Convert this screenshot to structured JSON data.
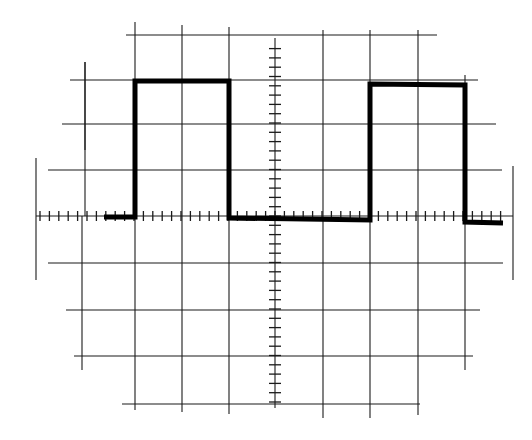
{
  "figure": {
    "type": "oscilloscope-graticule",
    "background": "#ffffff",
    "grid_color": "#1a1a1a",
    "trace_color": "#000000"
  },
  "graticule": {
    "vertical_lines": [
      {
        "x": 85,
        "y1": 62,
        "y2": 150
      },
      {
        "x": 85,
        "y1": 0,
        "y2": 0
      },
      {
        "x": 135,
        "y1": 22,
        "y2": 410
      },
      {
        "x": 182,
        "y1": 25,
        "y2": 412
      },
      {
        "x": 229,
        "y1": 27,
        "y2": 414
      },
      {
        "x": 323,
        "y1": 30,
        "y2": 418
      },
      {
        "x": 370,
        "y1": 30,
        "y2": 418
      },
      {
        "x": 418,
        "y1": 30,
        "y2": 415
      },
      {
        "x": 465,
        "y1": 75,
        "y2": 370
      }
    ],
    "outer_left_line": {
      "x": 36,
      "y1": 158,
      "y2": 280
    },
    "outer_right_line": {
      "x": 513,
      "y1": 166,
      "y2": 280
    },
    "extra_left_stubs": [
      {
        "x": 85,
        "y1": 62,
        "y2": 216
      },
      {
        "x": 82,
        "y1": 216,
        "y2": 370
      }
    ],
    "horizontal_lines": [
      {
        "y": 35,
        "x1": 126,
        "x2": 437
      },
      {
        "y": 80,
        "x1": 70,
        "x2": 478
      },
      {
        "y": 124,
        "x1": 62,
        "x2": 496
      },
      {
        "y": 170,
        "x1": 48,
        "x2": 502
      },
      {
        "y": 263,
        "x1": 48,
        "x2": 503
      },
      {
        "y": 310,
        "x1": 66,
        "x2": 480
      },
      {
        "y": 356,
        "x1": 74,
        "x2": 473
      },
      {
        "y": 404,
        "x1": 122,
        "x2": 420
      }
    ],
    "center_axis_h": {
      "y": 216,
      "x1": 36,
      "x2": 513,
      "minor_ticks_per_div": 5
    },
    "center_axis_v": {
      "x": 275,
      "y1": 38,
      "y2": 408,
      "minor_ticks_per_div": 5
    },
    "divisions": {
      "horizontal": 10,
      "vertical": 8
    }
  },
  "trace": {
    "waveform": "square",
    "low_level_div": 0,
    "high_level_div": 3,
    "points": [
      [
        104,
        217
      ],
      [
        135,
        217
      ],
      [
        135,
        81
      ],
      [
        229,
        81
      ],
      [
        229,
        218
      ],
      [
        370,
        220
      ],
      [
        370,
        84
      ],
      [
        465,
        85
      ],
      [
        465,
        222
      ],
      [
        503,
        223
      ]
    ]
  },
  "chart_data": {
    "type": "line",
    "title": "",
    "xlabel": "",
    "ylabel": "",
    "grid": true,
    "x_divisions": 10,
    "y_divisions": 8,
    "series": [
      {
        "name": "square wave",
        "x_div": [
          -3.6,
          -3,
          -3,
          -1,
          -1,
          2,
          2,
          4,
          4,
          4.8
        ],
        "y_div": [
          0,
          0,
          3,
          3,
          0,
          0,
          3,
          3,
          0,
          0
        ]
      }
    ],
    "period_div": 5,
    "high_duration_div": 2,
    "low_duration_div": 3,
    "amplitude_div": 3
  }
}
